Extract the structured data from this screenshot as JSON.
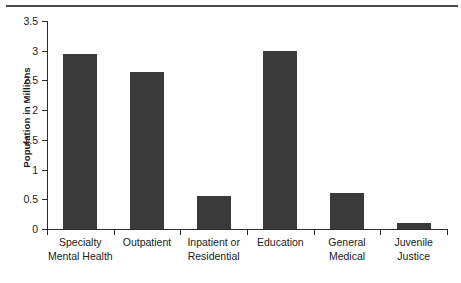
{
  "chart_data": {
    "type": "bar",
    "title": "",
    "xlabel": "",
    "ylabel": "Population in Millions",
    "ylim": [
      0,
      3.5
    ],
    "ytick_labels": [
      "0",
      "0.5",
      "1",
      "1.5",
      "2",
      "2.5",
      "3",
      "3.5"
    ],
    "ytick_values": [
      0,
      0.5,
      1,
      1.5,
      2,
      2.5,
      3,
      3.5
    ],
    "grid": false,
    "legend": null,
    "categories": [
      "Specialty Mental Health",
      "Outpatient",
      "Inpatient or Residential",
      "Education",
      "General Medical",
      "Juvenile Justice"
    ],
    "category_label_lines": [
      [
        "Specialty",
        "Mental Health"
      ],
      [
        "Outpatient",
        ""
      ],
      [
        "Inpatient or",
        "Residential"
      ],
      [
        "Education",
        ""
      ],
      [
        "General",
        "Medical"
      ],
      [
        "Juvenile",
        "Justice"
      ]
    ],
    "values": [
      2.95,
      2.65,
      0.55,
      3.0,
      0.6,
      0.1
    ],
    "bar_color": "#3a3a3a",
    "axis_color": "#2b2b2b",
    "background_color": "#ffffff"
  }
}
